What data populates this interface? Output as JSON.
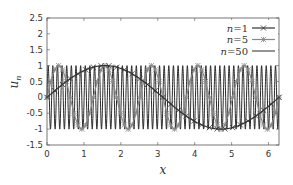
{
  "chart_data": {
    "type": "line",
    "title": "",
    "xlabel": "x",
    "ylabel": "u_n",
    "xlim": [
      0,
      6.2832
    ],
    "ylim": [
      -1.5,
      2.5
    ],
    "xticks": [
      "0",
      "1",
      "2",
      "3",
      "4",
      "5",
      "6"
    ],
    "yticks": [
      "2.5",
      "2",
      "1.5",
      "1",
      "0.5",
      "0",
      "-0.5",
      "-1",
      "-1.5"
    ],
    "grid": false,
    "legend_position": "upper right",
    "series": [
      {
        "name": "n=1",
        "function": "sin(1*x)",
        "n": 1,
        "color": "#333333",
        "marker": "x-star",
        "line_width": 1.2
      },
      {
        "name": "n=5",
        "function": "sin(5*x)",
        "n": 5,
        "color": "#888888",
        "marker": "star",
        "line_width": 1.2
      },
      {
        "name": "n=50",
        "function": "sin(50*x)",
        "n": 50,
        "color": "#111111",
        "marker": "none",
        "line_width": 0.9
      }
    ]
  },
  "legend": {
    "entries": [
      {
        "label_n": "n",
        "label_eq": "=1"
      },
      {
        "label_n": "n",
        "label_eq": "=5"
      },
      {
        "label_n": "n",
        "label_eq": "=50"
      }
    ]
  },
  "axes": {
    "xlabel": "x",
    "ylabel_base": "u",
    "ylabel_sub": "n"
  }
}
